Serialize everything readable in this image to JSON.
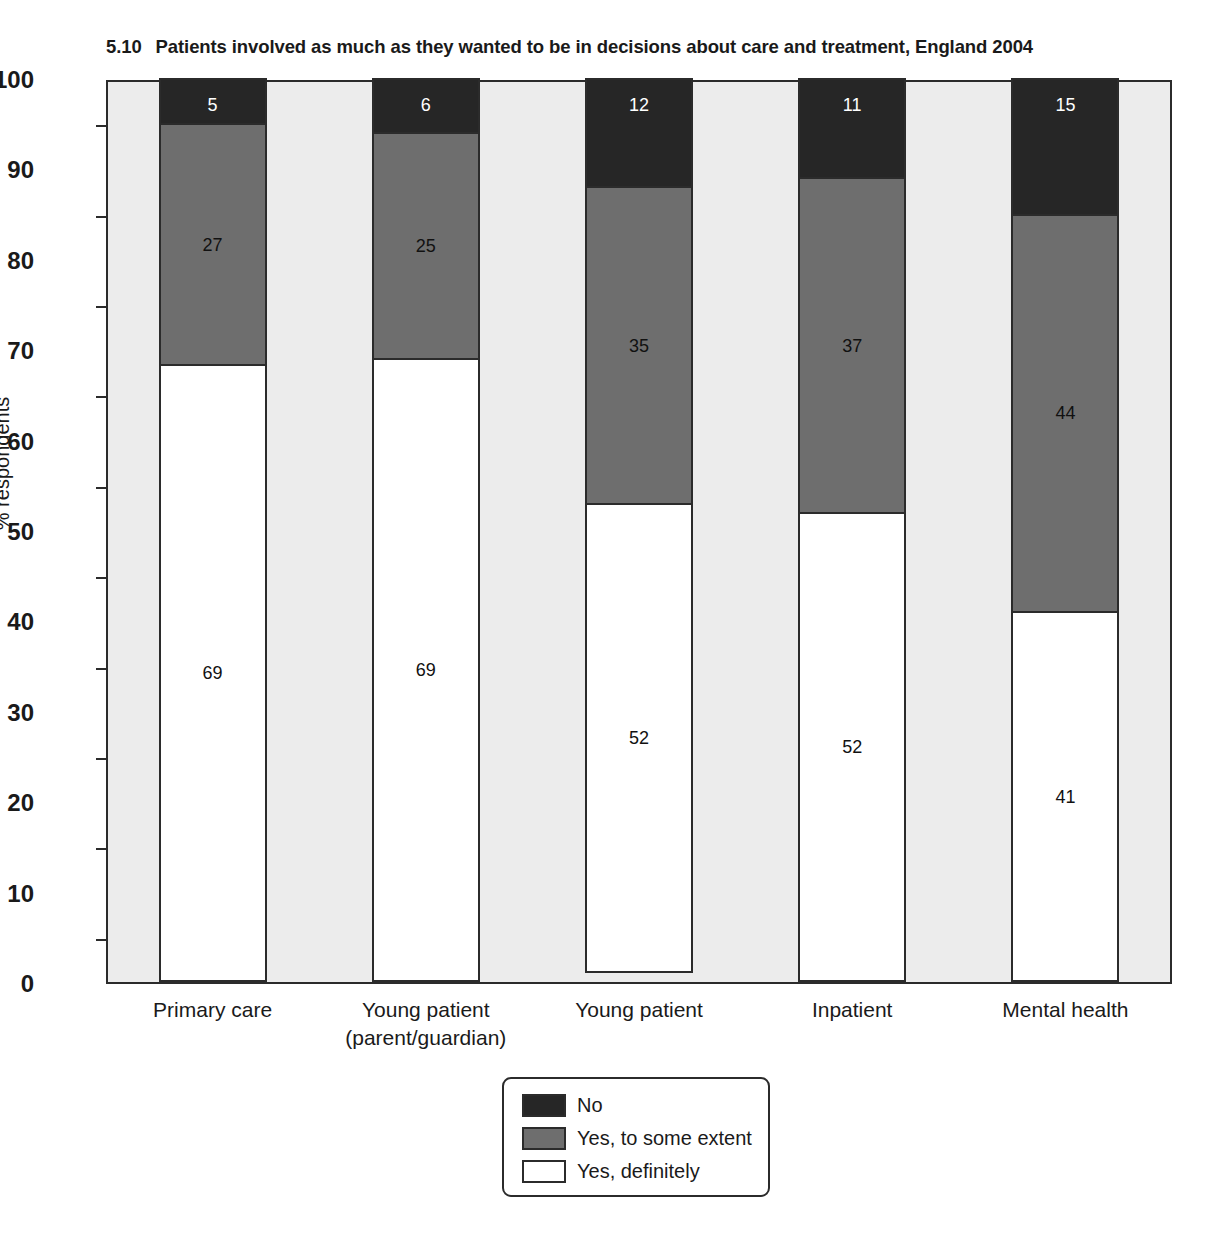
{
  "chart_data": {
    "type": "bar",
    "subtype": "stacked-bar-100",
    "title_number": "5.10",
    "title_text": "Patients involved as much as they wanted to be in decisions about care and treatment, England 2004",
    "xlabel": "",
    "ylabel": "% respondents",
    "ylim": [
      0,
      100
    ],
    "y_ticks": [
      0,
      10,
      20,
      30,
      40,
      50,
      60,
      70,
      80,
      90,
      100
    ],
    "y_minor_ticks": [
      5,
      15,
      25,
      35,
      45,
      55,
      65,
      75,
      85,
      95
    ],
    "grid": false,
    "legend_position": "bottom-center",
    "categories": [
      "Primary care",
      "Young patient\n(parent/guardian)",
      "Young patient",
      "Inpatient",
      "Mental health"
    ],
    "series": [
      {
        "name": "No",
        "color": "#262626",
        "values": [
          5,
          6,
          12,
          11,
          15
        ]
      },
      {
        "name": "Yes, to some extent",
        "color": "#6e6e6e",
        "values": [
          27,
          25,
          35,
          37,
          44
        ]
      },
      {
        "name": "Yes, definitely",
        "color": "#ffffff",
        "values": [
          69,
          69,
          52,
          52,
          41
        ]
      }
    ],
    "stack_order_bottom_to_top": [
      "Yes, definitely",
      "Yes, to some extent",
      "No"
    ]
  },
  "axis": {
    "y_label": "% respondents",
    "y_ticks": [
      "100",
      "90",
      "80",
      "70",
      "60",
      "50",
      "40",
      "30",
      "20",
      "10",
      "0"
    ],
    "x_labels": [
      "Primary care",
      "Young patient\n(parent/guardian)",
      "Young patient",
      "Inpatient",
      "Mental health"
    ]
  },
  "legend": {
    "items": [
      {
        "label": "No",
        "color": "#262626"
      },
      {
        "label": "Yes, to some extent",
        "color": "#6e6e6e"
      },
      {
        "label": "Yes, definitely",
        "color": "#ffffff"
      }
    ]
  },
  "bar_labels": {
    "no": [
      "5",
      "6",
      "12",
      "11",
      "15"
    ],
    "some": [
      "27",
      "25",
      "35",
      "37",
      "44"
    ],
    "definitely": [
      "69",
      "69",
      "52",
      "52",
      "41"
    ]
  },
  "colors": {
    "plot_background": "#ececec",
    "axis_line": "#2b2b2b",
    "page_background": "#ffffff",
    "no": "#262626",
    "some": "#6e6e6e",
    "definitely": "#ffffff"
  }
}
